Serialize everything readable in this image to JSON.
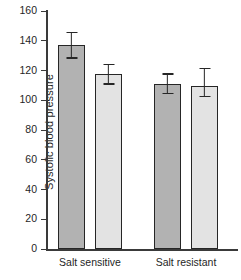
{
  "chart_data": {
    "type": "bar",
    "title": "",
    "xlabel": "",
    "ylabel": "Systolic blood pressure",
    "ylim": [
      0,
      160
    ],
    "yticks": [
      0,
      20,
      40,
      60,
      80,
      100,
      120,
      140,
      160
    ],
    "ytick_labels": [
      "0",
      "20",
      "40",
      "60",
      "80",
      "100",
      "120",
      "140",
      "160"
    ],
    "grid": false,
    "legend": "none",
    "categories": [
      "Salt sensitive",
      "Salt resistant"
    ],
    "series": [
      {
        "name": "group-1",
        "color": "#b2b2b2",
        "values": [
          137,
          111
        ],
        "errors": [
          9,
          7
        ]
      },
      {
        "name": "group-2",
        "color": "#e3e3e3",
        "values": [
          117.5,
          109.5
        ],
        "errors": [
          7,
          7.5
        ]
      }
    ],
    "bars": [
      {
        "id": "bar-1",
        "category": "Salt sensitive",
        "series": "group-1",
        "value": 137,
        "error_low": 128,
        "error_high": 146,
        "fill": "#b2b2b2"
      },
      {
        "id": "bar-2",
        "category": "Salt sensitive",
        "series": "group-2",
        "value": 117.5,
        "error_low": 110.5,
        "error_high": 124.5,
        "fill": "#e3e3e3"
      },
      {
        "id": "bar-3",
        "category": "Salt resistant",
        "series": "group-1",
        "value": 111,
        "error_low": 104,
        "error_high": 118,
        "fill": "#b2b2b2"
      },
      {
        "id": "bar-4",
        "category": "Salt resistant",
        "series": "group-2",
        "value": 109.5,
        "error_low": 102,
        "error_high": 122,
        "fill": "#e3e3e3"
      }
    ]
  },
  "axis": {
    "y_title": "Systolic blood pressure",
    "ticks": [
      {
        "label": "160",
        "value": 160
      },
      {
        "label": "140",
        "value": 140
      },
      {
        "label": "120",
        "value": 120
      },
      {
        "label": "100",
        "value": 100
      },
      {
        "label": "80",
        "value": 80
      },
      {
        "label": "60",
        "value": 60
      },
      {
        "label": "40",
        "value": 40
      },
      {
        "label": "20",
        "value": 20
      },
      {
        "label": "0",
        "value": 0
      }
    ]
  },
  "categories": [
    {
      "label": "Salt sensitive"
    },
    {
      "label": "Salt resistant"
    }
  ],
  "colors": {
    "bar_dark": "#b2b2b2",
    "bar_light": "#e3e3e3",
    "axis": "#3a3a3a",
    "outline": "#262626",
    "background": "#ffffff",
    "text": "#1f1f1f"
  }
}
